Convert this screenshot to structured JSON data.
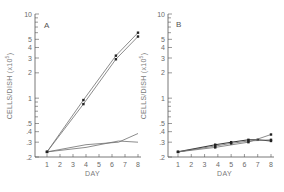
{
  "chart_data": [
    {
      "panel": "A",
      "type": "line",
      "title": "",
      "panel_label": "A",
      "xlabel": "DAY",
      "ylabel": "CELLS/DISH (x10^5)",
      "ylabel_display": "CELLS/DISH (x10",
      "ylabel_exp": "5",
      "yscale": "log",
      "ylim": [
        0.2,
        10
      ],
      "xlim": [
        1,
        8
      ],
      "x_ticks": [
        1,
        2,
        3,
        4,
        5,
        6,
        7,
        8
      ],
      "y_tick_labels": [
        "10",
        "5",
        "4",
        "3",
        "2",
        "1",
        ".5",
        ".4",
        ".3",
        ".2"
      ],
      "y_tick_values": [
        10,
        5,
        4,
        3,
        2,
        1,
        0.5,
        0.4,
        0.3,
        0.2
      ],
      "grid": false,
      "series": [
        {
          "name": "growing-1",
          "x": [
            1,
            3.8,
            6.3,
            8
          ],
          "y": [
            0.23,
            0.95,
            3.2,
            6.0
          ],
          "markers": true
        },
        {
          "name": "growing-2",
          "x": [
            1,
            3.8,
            6.3,
            8
          ],
          "y": [
            0.23,
            0.85,
            2.9,
            5.4
          ],
          "markers": true
        },
        {
          "name": "flat-1",
          "x": [
            1,
            4,
            6.5,
            8
          ],
          "y": [
            0.23,
            0.28,
            0.3,
            0.38
          ],
          "markers": false
        },
        {
          "name": "flat-2",
          "x": [
            1,
            4,
            6.5,
            8
          ],
          "y": [
            0.23,
            0.26,
            0.31,
            0.3
          ],
          "markers": false
        }
      ]
    },
    {
      "panel": "B",
      "type": "line",
      "title": "",
      "panel_label": "B",
      "xlabel": "DAY",
      "ylabel": "CELLS/DISH (x10^5)",
      "ylabel_display": "CELLS/DISH (x10",
      "ylabel_exp": "5",
      "yscale": "log",
      "ylim": [
        0.2,
        10
      ],
      "xlim": [
        1,
        8
      ],
      "x_ticks": [
        1,
        2,
        3,
        4,
        5,
        6,
        7,
        8
      ],
      "y_tick_labels": [
        "10",
        "5",
        "4",
        "3",
        "2",
        "1",
        ".5",
        ".4",
        ".3",
        ".2"
      ],
      "y_tick_values": [
        10,
        5,
        4,
        3,
        2,
        1,
        0.5,
        0.4,
        0.3,
        0.2
      ],
      "grid": false,
      "series": [
        {
          "name": "series-1",
          "x": [
            1,
            3.8,
            5,
            6.3,
            7,
            8
          ],
          "y": [
            0.23,
            0.28,
            0.3,
            0.32,
            0.32,
            0.31
          ],
          "markers": true
        },
        {
          "name": "series-2",
          "x": [
            1,
            3.8,
            6.3,
            8
          ],
          "y": [
            0.23,
            0.26,
            0.3,
            0.37
          ],
          "markers": true
        },
        {
          "name": "series-3",
          "x": [
            1,
            3.8,
            5,
            6.3,
            8
          ],
          "y": [
            0.23,
            0.27,
            0.29,
            0.31,
            0.32
          ],
          "markers": true
        }
      ]
    }
  ],
  "colors": {
    "axis": "#555555",
    "line": "#6f6f6f",
    "line_dark": "#3a3a3a",
    "marker": "#222222",
    "text": "#6a6a6a"
  }
}
